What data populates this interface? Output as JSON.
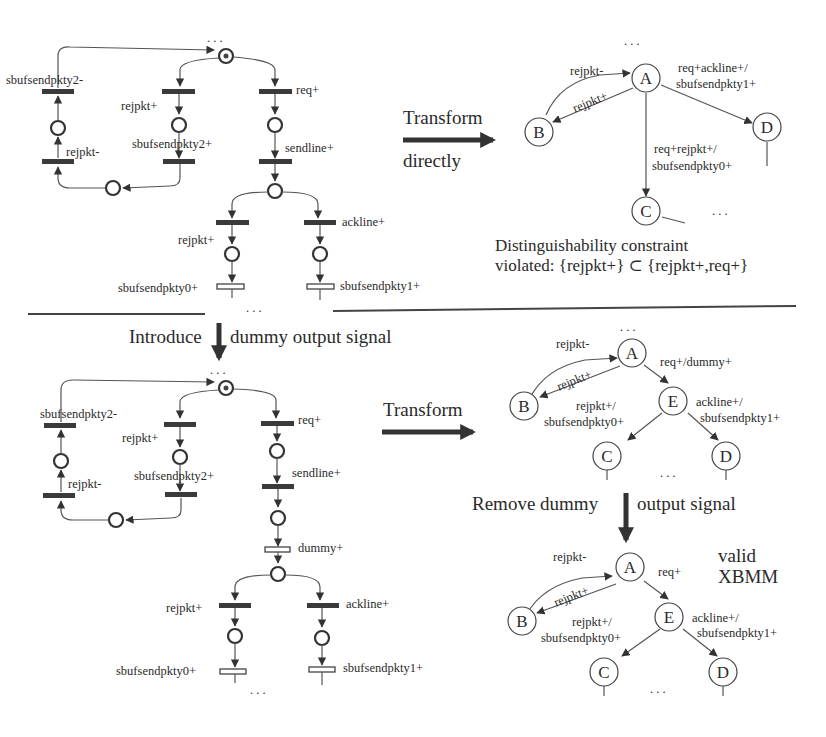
{
  "petri_net_top": {
    "transitions": {
      "sbufsendpkty2_minus": "sbufsendpkty2-",
      "rejpkt_plus_left": "rejpkt+",
      "req_plus": "req+",
      "rejpkt_minus": "rejpkt-",
      "sbufsendpkty2_plus": "sbufsendpkty2+",
      "sendline_plus": "sendline+",
      "rejpkt_plus_branch": "rejpkt+",
      "ackline_plus": "ackline+",
      "sbufsendpkty0_plus": "sbufsendpkty0+",
      "sbufsendpkty1_plus": "sbufsendpkty1+"
    },
    "ellipsis": ". . ."
  },
  "transform_direct": {
    "label_top": "Transform",
    "label_bottom": "directly"
  },
  "xbm_top": {
    "nodes": [
      "A",
      "B",
      "C",
      "D"
    ],
    "edges": {
      "a_to_b": "rejpkt+",
      "b_to_a": "rejpkt-",
      "a_to_d_line1": "req+ackline+/",
      "a_to_d_line2": "sbufsendpkty1+",
      "a_to_c_line1": "req+rejpkt+/",
      "a_to_c_line2": "sbufsendpkty0+"
    },
    "ellipsis": ". . .",
    "violation_line1": "Distinguishability constraint",
    "violation_line2": "violated: {rejpkt+} ⊂ {rejpkt+,req+}"
  },
  "introduce_step": {
    "label_left": "Introduce",
    "label_right": "dummy output signal"
  },
  "petri_net_bottom": {
    "transitions": {
      "sbufsendpkty2_minus": "sbufsendpkty2-",
      "rejpkt_plus_left": "rejpkt+",
      "req_plus": "req+",
      "rejpkt_minus": "rejpkt-",
      "sbufsendpkty2_plus": "sbufsendpkty2+",
      "sendline_plus": "sendline+",
      "dummy_plus": "dummy+",
      "rejpkt_plus_branch": "rejpkt+",
      "ackline_plus": "ackline+",
      "sbufsendpkty0_plus": "sbufsendpkty0+",
      "sbufsendpkty1_plus": "sbufsendpkty1+"
    },
    "ellipsis": ". . ."
  },
  "transform_second": {
    "label": "Transform"
  },
  "xbm_dummy": {
    "nodes": [
      "A",
      "B",
      "E",
      "C",
      "D"
    ],
    "edges": {
      "b_to_a": "rejpkt-",
      "a_to_b": "rejpkt+",
      "a_to_e": "req+/dummy+",
      "e_to_c_line1": "rejpkt+/",
      "e_to_c_line2": "sbufsendpkty0+",
      "e_to_d_line1": "ackline+/",
      "e_to_d_line2": "sbufsendpkty1+"
    },
    "ellipsis": ". . ."
  },
  "remove_step": {
    "label_left": "Remove dummy",
    "label_right": "output signal"
  },
  "xbm_final": {
    "nodes": [
      "A",
      "B",
      "E",
      "C",
      "D"
    ],
    "edges": {
      "b_to_a": "rejpkt-",
      "a_to_b": "rejpkt+",
      "a_to_e": "req+",
      "e_to_c_line1": "rejpkt+/",
      "e_to_c_line2": "sbufsendpkty0+",
      "e_to_d_line1": "ackline+/",
      "e_to_d_line2": "sbufsendpkty1+"
    },
    "ellipsis": ". . .",
    "result_line1": "valid",
    "result_line2": "XBMM"
  }
}
